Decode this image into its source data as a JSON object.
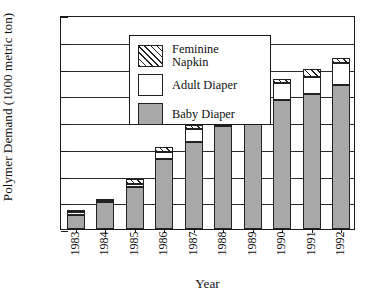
{
  "chart_data": {
    "type": "bar",
    "stacked": true,
    "title": "",
    "xlabel": "Year",
    "ylabel": "Polymer Demand (1000 metric ton)",
    "categories": [
      "1983",
      "1984",
      "1985",
      "1986",
      "1987",
      "1988",
      "1989",
      "1990",
      "1991",
      "1992"
    ],
    "ylim": [
      0,
      40
    ],
    "yticks": [
      0,
      5,
      10,
      15,
      20,
      25,
      30,
      35,
      40
    ],
    "ytick_labels": [
      "0",
      "5",
      "10",
      "15",
      "20",
      "25",
      "30",
      "35",
      "40"
    ],
    "grid": "horizontal",
    "legend_position": "upper-left-inset",
    "series": [
      {
        "name": "Baby Diaper",
        "fill": "gray-dotted",
        "color": "#a8a8a8",
        "values": [
          2.6,
          5.0,
          7.8,
          13.0,
          16.2,
          19.2,
          22.5,
          24.1,
          25.3,
          26.9
        ]
      },
      {
        "name": "Adult Diaper",
        "fill": "white",
        "color": "#ffffff",
        "values": [
          0.5,
          0.4,
          0.6,
          1.4,
          2.4,
          2.1,
          2.6,
          3.1,
          3.2,
          4.1
        ]
      },
      {
        "name": "Feminine Napkin",
        "fill": "diagonal-hatch",
        "color": "#ffffff",
        "values": [
          0.4,
          0.3,
          0.9,
          1.0,
          0.9,
          0.9,
          0.9,
          0.8,
          1.5,
          1.0
        ]
      }
    ],
    "totals": [
      3.5,
      5.7,
      9.3,
      15.4,
      19.5,
      22.2,
      26.0,
      28.0,
      30.0,
      32.0
    ]
  },
  "legend": {
    "items": [
      {
        "label": "Feminine Napkin",
        "swatch": "diagonal-hatch"
      },
      {
        "label": "Adult Diaper",
        "swatch": "white"
      },
      {
        "label": "Baby Diaper",
        "swatch": "gray-dotted"
      }
    ]
  }
}
